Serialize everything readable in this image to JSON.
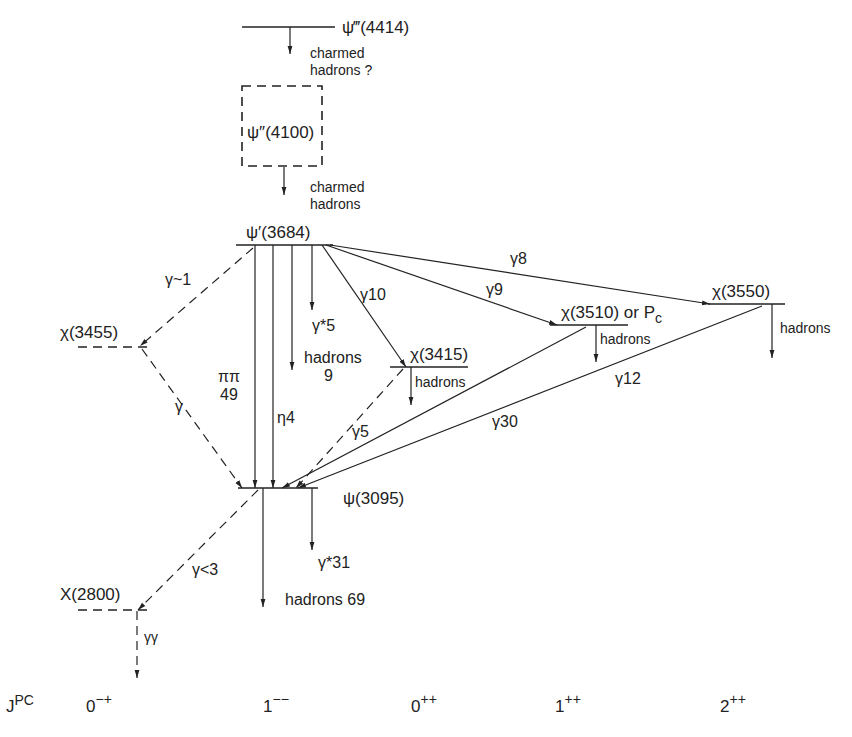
{
  "states": {
    "psi4414": {
      "label": "ψ‴(4414)",
      "note_line1": "charmed",
      "note_line2": "hadrons ?"
    },
    "psi4100": {
      "label": "ψ″(4100)",
      "note_line1": "charmed",
      "note_line2": "hadrons"
    },
    "psi3684": {
      "label": "ψ′(3684)"
    },
    "chi3455": {
      "label": "χ(3455)"
    },
    "chi3415": {
      "label": "χ(3415)",
      "decay": "hadrons"
    },
    "chi3510": {
      "label": "χ(3510) or P",
      "label_sub": "c",
      "decay": "hadrons"
    },
    "chi3550": {
      "label": "χ(3550)",
      "decay": "hadrons"
    },
    "psi3095": {
      "label": "ψ(3095)"
    },
    "x2800": {
      "label": "X(2800)"
    }
  },
  "transitions": {
    "psi3684_to_chi3455": "γ~1",
    "chi3455_to_psi3095": "γ",
    "psi3684_pipi": {
      "line1": "ππ",
      "line2": "49"
    },
    "psi3684_eta": "η4",
    "psi3684_hadrons": {
      "line1": "hadrons",
      "line2": "9"
    },
    "psi3684_gammastar": "γ*5",
    "psi3684_to_chi3415": "γ10",
    "psi3684_to_chi3510": "γ9",
    "psi3684_to_chi3550": "γ8",
    "chi3415_to_psi3095": "γ5",
    "chi3510_to_psi3095": "γ30",
    "chi3550_to_psi3095": "γ12",
    "psi3095_gammastar": "γ*31",
    "psi3095_hadrons": "hadrons 69",
    "psi3095_to_x2800": "γ<3",
    "x2800_decay": "γγ"
  },
  "jpc_axis": {
    "label": "J",
    "label_sup": "PC",
    "columns": [
      {
        "j": "0",
        "pc": "−+"
      },
      {
        "j": "1",
        "pc": "−−"
      },
      {
        "j": "0",
        "pc": "++"
      },
      {
        "j": "1",
        "pc": "++"
      },
      {
        "j": "2",
        "pc": "++"
      }
    ]
  }
}
